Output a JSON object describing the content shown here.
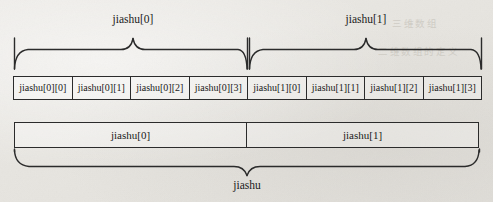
{
  "diagram": {
    "ink_color": "#2b2b2b",
    "paper_color": "#eae8e4",
    "top_braces": [
      {
        "label": "jiashu[0]",
        "spans_cells": [
          0,
          1,
          2,
          3
        ]
      },
      {
        "label": "jiashu[1]",
        "spans_cells": [
          4,
          5,
          6,
          7
        ]
      }
    ],
    "cells": [
      {
        "label": "jiashu[0][0]"
      },
      {
        "label": "jiashu[0][1]"
      },
      {
        "label": "jiashu[0][2]"
      },
      {
        "label": "jiashu[0][3]"
      },
      {
        "label": "jiashu[1][0]"
      },
      {
        "label": "jiashu[1][1]"
      },
      {
        "label": "jiashu[1][2]"
      },
      {
        "label": "jiashu[1][3]"
      }
    ],
    "groups": [
      {
        "label": "jiashu[0]"
      },
      {
        "label": "jiashu[1]"
      }
    ],
    "bottom_brace": {
      "label": "jiashu"
    },
    "bleed_through": [
      {
        "text": "三维数组",
        "x": 392,
        "y": 16
      },
      {
        "text": "二维数组的定义",
        "x": 378,
        "y": 44
      }
    ]
  }
}
